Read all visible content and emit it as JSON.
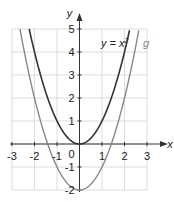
{
  "chart_data": {
    "type": "line",
    "title": "",
    "xlabel": "x",
    "ylabel": "y",
    "xlim": [
      -3,
      3
    ],
    "ylim": [
      -2,
      5
    ],
    "grid": true,
    "xticks": [
      "-3",
      "-2",
      "-1",
      "0",
      "1",
      "2",
      "3"
    ],
    "yticks": [
      "5",
      "4",
      "3",
      "2",
      "1",
      "-1",
      "-2"
    ],
    "origin_label": "0",
    "series": [
      {
        "name": "y = x²",
        "label_text": "y = x",
        "label_sup": "2",
        "formula": "x^2",
        "color": "#333333",
        "x": [
          -2.24,
          -2,
          -1.5,
          -1,
          -0.5,
          0,
          0.5,
          1,
          1.5,
          2,
          2.24
        ],
        "y": [
          5,
          4,
          2.25,
          1,
          0.25,
          0,
          0.25,
          1,
          2.25,
          4,
          5
        ]
      },
      {
        "name": "g",
        "label_text": "g",
        "formula": "x^2 - 2",
        "color": "#888888",
        "x": [
          -2.65,
          -2,
          -1.41,
          -1,
          0,
          1,
          1.41,
          2,
          2.65
        ],
        "y": [
          5,
          2,
          0,
          -1,
          -2,
          -1,
          0,
          2,
          5
        ]
      }
    ]
  }
}
